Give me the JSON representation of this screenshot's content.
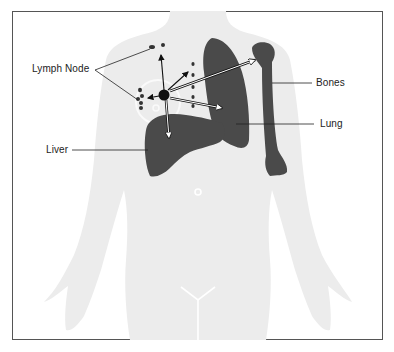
{
  "diagram": {
    "labels": {
      "lymph_node": "Lymph Node",
      "bones": "Bones",
      "lung": "Lung",
      "liver": "Liver"
    },
    "colors": {
      "frame": "#555555",
      "silhouette": "#ececec",
      "organ": "#4a4a4a",
      "tumor": "#111111",
      "text": "#222222",
      "leader": "#222222"
    }
  }
}
